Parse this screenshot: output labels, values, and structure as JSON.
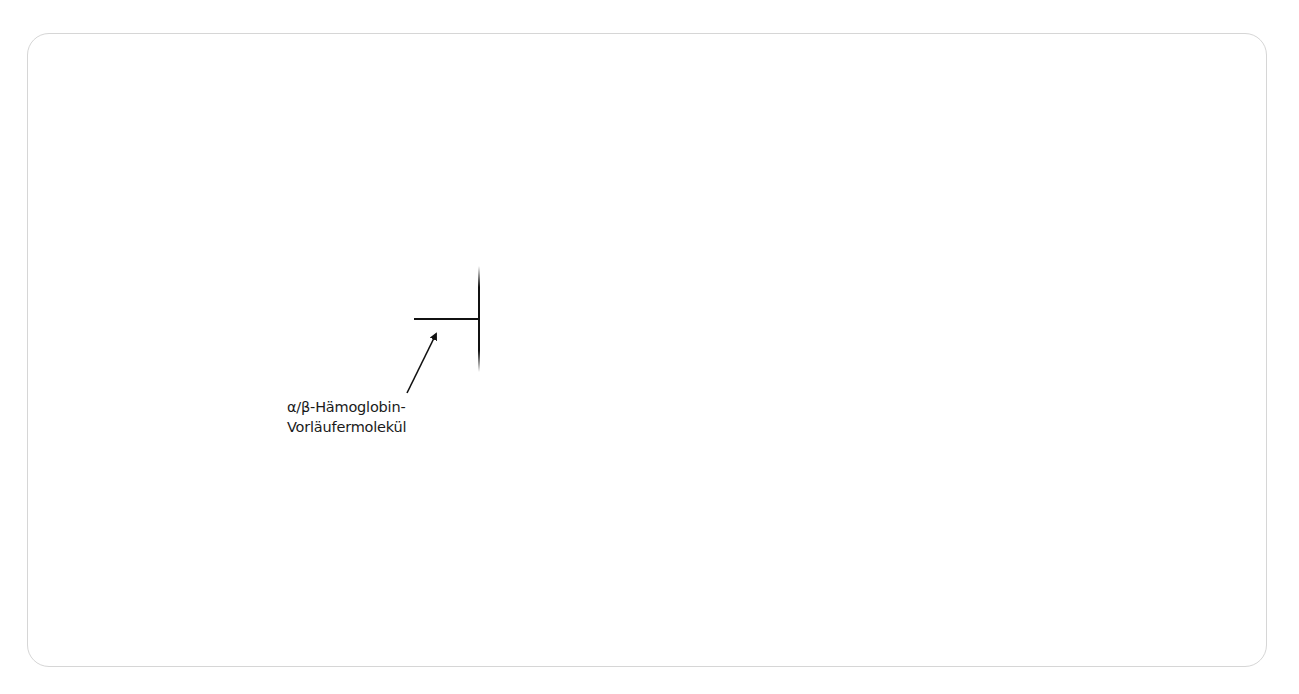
{
  "diagram": {
    "label": {
      "line1": "α/β-Hämoglobin-",
      "line2": "Vorläufermolekül"
    },
    "elements": {
      "vertical_bar": {
        "x": 479,
        "y1": 268,
        "y2": 370
      },
      "horizontal_stub": {
        "x1": 414,
        "x2": 479,
        "y": 319
      },
      "arrow": {
        "from": [
          407,
          393
        ],
        "to": [
          438,
          330
        ]
      }
    },
    "colors": {
      "stroke": "#111111",
      "frame_border": "#d6d6d6",
      "text": "#1a1a1a"
    }
  }
}
